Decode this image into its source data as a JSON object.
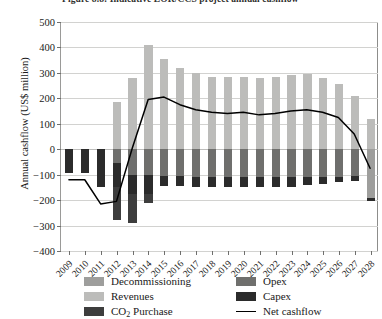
{
  "caption": "Figure 8.8: Indicative EOR/CCS project annual cashflow",
  "axes": {
    "ylabel": "Annual cashflow (US$ million)",
    "yticks": [
      500,
      400,
      300,
      200,
      100,
      0,
      -100,
      -200,
      -300,
      -400
    ],
    "ytick_labels": [
      "500",
      "400",
      "300",
      "200",
      "100",
      "0",
      "−100",
      "−200",
      "−300",
      "−400"
    ]
  },
  "legend": {
    "items": [
      {
        "label": "Decommissioning",
        "color": "#9e9e9c",
        "type": "swatch"
      },
      {
        "label": "Revenues",
        "color": "#bcbcba",
        "type": "swatch"
      },
      {
        "label": "CO2 Purchase",
        "color": "#3d3d3d",
        "type": "swatch",
        "sub": "2"
      },
      {
        "label": "Opex",
        "color": "#6f6f6d",
        "type": "swatch"
      },
      {
        "label": "Capex",
        "color": "#2b2b2b",
        "type": "swatch"
      },
      {
        "label": "Net cashflow",
        "color": "#000000",
        "type": "line"
      }
    ]
  },
  "chart_data": {
    "type": "bar",
    "title": "Figure 8.8: Indicative EOR/CCS project annual cashflow",
    "xlabel": "",
    "ylabel": "Annual cashflow (US$ million)",
    "ylim": [
      -400,
      500
    ],
    "grid": true,
    "legend_position": "bottom",
    "stacked": true,
    "categories": [
      "2009",
      "2010",
      "2011",
      "2012",
      "2013",
      "2014",
      "2015",
      "2016",
      "2017",
      "2018",
      "2019",
      "2020",
      "2021",
      "2022",
      "2023",
      "2024",
      "2025",
      "2026",
      "2027",
      "2028"
    ],
    "series": [
      {
        "name": "Revenues",
        "color": "#bcbcba",
        "values": [
          0,
          0,
          0,
          185,
          280,
          410,
          355,
          320,
          300,
          285,
          285,
          285,
          280,
          285,
          290,
          295,
          280,
          255,
          210,
          120
        ]
      },
      {
        "name": "Decommissioning",
        "color": "#9e9e9c",
        "values": [
          0,
          0,
          0,
          0,
          0,
          0,
          0,
          0,
          0,
          0,
          0,
          0,
          0,
          0,
          0,
          0,
          0,
          0,
          0,
          -190
        ]
      },
      {
        "name": "Opex",
        "color": "#6f6f6d",
        "values": [
          0,
          0,
          0,
          -55,
          -100,
          -100,
          -105,
          -105,
          -110,
          -110,
          -110,
          -110,
          -110,
          -110,
          -110,
          -110,
          -110,
          -110,
          -105,
          0
        ]
      },
      {
        "name": "Capex",
        "color": "#2b2b2b",
        "values": [
          -95,
          -95,
          -150,
          -95,
          -75,
          -75,
          -40,
          -40,
          -40,
          -40,
          -40,
          -40,
          -40,
          -40,
          -40,
          -30,
          -25,
          -20,
          -20,
          -15
        ]
      },
      {
        "name": "CO2 Purchase",
        "color": "#3d3d3d",
        "values": [
          0,
          0,
          0,
          -130,
          -115,
          -35,
          0,
          0,
          0,
          0,
          0,
          0,
          0,
          0,
          0,
          0,
          0,
          0,
          0,
          0
        ]
      }
    ],
    "line_series": {
      "name": "Net cashflow",
      "color": "#000000",
      "values": [
        -120,
        -120,
        -215,
        -205,
        5,
        195,
        205,
        175,
        155,
        145,
        140,
        145,
        135,
        140,
        150,
        155,
        145,
        125,
        60,
        -75
      ]
    }
  }
}
